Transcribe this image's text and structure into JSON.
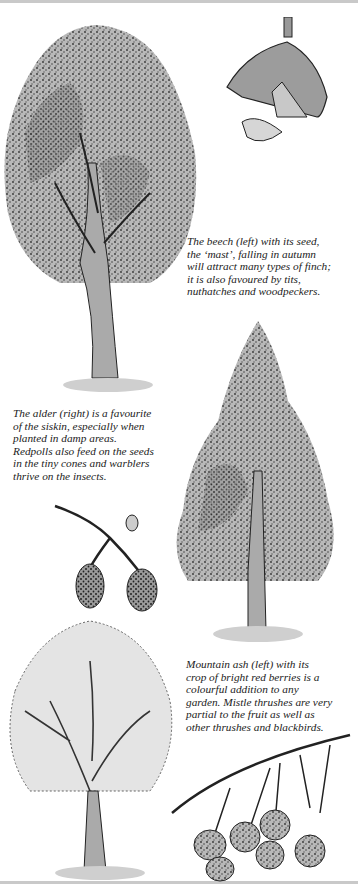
{
  "page": {
    "background": "#ffffff",
    "ink_color": "#1c1c1c",
    "foliage_gray": "#b4b4b4"
  },
  "illustrations": [
    {
      "id": "beech-tree",
      "label": "Beech tree"
    },
    {
      "id": "beech-mast",
      "label": "Beech seed (mast) and husk"
    },
    {
      "id": "alder-tree",
      "label": "Alder tree"
    },
    {
      "id": "alder-cones",
      "label": "Alder cones on twig"
    },
    {
      "id": "mountain-ash-tree",
      "label": "Mountain ash tree"
    },
    {
      "id": "rowan-berries",
      "label": "Mountain ash berries"
    }
  ],
  "captions": {
    "beech": "The beech (left) with its seed,\nthe ‘mast’, falling in autumn\nwill attract many types of finch;\nit is also favoured by tits,\nnuthatches and woodpeckers.",
    "alder": "The alder (right) is a favourite\nof the siskin, especially when\nplanted in damp areas.\nRedpolls also feed on the seeds\nin the tiny cones and warblers\nthrive on the insects.",
    "mountain_ash": "Mountain ash (left) with its\ncrop of bright red berries is a\ncolourful addition to any\ngarden. Mistle thrushes are very\npartial to the fruit as well as\nother thrushes and blackbirds."
  }
}
